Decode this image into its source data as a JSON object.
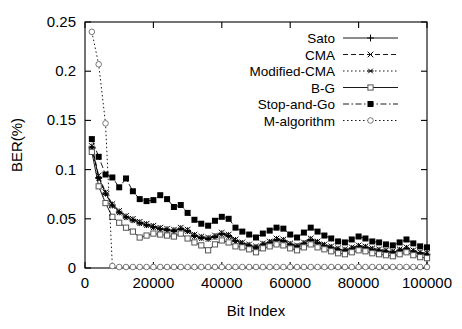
{
  "chart_data": {
    "type": "line",
    "title": "",
    "xlabel": "Bit Index",
    "ylabel": "BER(%)",
    "xlim": [
      0,
      100000
    ],
    "ylim": [
      0,
      0.25
    ],
    "xticks": [
      0,
      20000,
      40000,
      60000,
      80000,
      100000
    ],
    "xtick_labels": [
      "0",
      "20000",
      "40000",
      "60000",
      "80000",
      "100000"
    ],
    "yticks": [
      0,
      0.05,
      0.1,
      0.15,
      0.2,
      0.25
    ],
    "ytick_labels": [
      "0",
      "0.05",
      "0.1",
      "0.15",
      "0.2",
      "0.25"
    ],
    "grid": false,
    "legend_position": "top-right",
    "x": [
      2000,
      4000,
      6000,
      8000,
      10000,
      12000,
      14000,
      16000,
      18000,
      20000,
      22000,
      24000,
      26000,
      28000,
      30000,
      32000,
      34000,
      36000,
      38000,
      40000,
      42000,
      44000,
      46000,
      48000,
      50000,
      52000,
      54000,
      56000,
      58000,
      60000,
      62000,
      64000,
      66000,
      68000,
      70000,
      72000,
      74000,
      76000,
      78000,
      80000,
      82000,
      84000,
      86000,
      88000,
      90000,
      92000,
      94000,
      96000,
      98000,
      100000
    ],
    "series": [
      {
        "name": "Sato",
        "marker": "plus",
        "line_style": "solid",
        "color": "#000000",
        "values": [
          0.123,
          0.092,
          0.076,
          0.064,
          0.057,
          0.052,
          0.049,
          0.046,
          0.044,
          0.042,
          0.04,
          0.039,
          0.038,
          0.04,
          0.038,
          0.033,
          0.031,
          0.03,
          0.032,
          0.035,
          0.033,
          0.028,
          0.025,
          0.023,
          0.021,
          0.024,
          0.026,
          0.029,
          0.028,
          0.024,
          0.022,
          0.025,
          0.029,
          0.026,
          0.023,
          0.021,
          0.019,
          0.018,
          0.02,
          0.022,
          0.021,
          0.019,
          0.018,
          0.017,
          0.016,
          0.018,
          0.02,
          0.017,
          0.015,
          0.014
        ]
      },
      {
        "name": "CMA",
        "marker": "cross",
        "line_style": "dashed",
        "color": "#000000",
        "values": [
          0.124,
          0.094,
          0.077,
          0.065,
          0.058,
          0.053,
          0.05,
          0.047,
          0.045,
          0.043,
          0.041,
          0.04,
          0.039,
          0.041,
          0.039,
          0.034,
          0.032,
          0.031,
          0.033,
          0.036,
          0.034,
          0.029,
          0.026,
          0.024,
          0.022,
          0.025,
          0.027,
          0.03,
          0.029,
          0.025,
          0.023,
          0.026,
          0.03,
          0.027,
          0.024,
          0.022,
          0.02,
          0.019,
          0.021,
          0.023,
          0.022,
          0.02,
          0.019,
          0.018,
          0.017,
          0.019,
          0.021,
          0.018,
          0.016,
          0.015
        ]
      },
      {
        "name": "Modified-CMA",
        "marker": "star",
        "line_style": "dotted",
        "color": "#000000",
        "values": [
          0.122,
          0.091,
          0.075,
          0.063,
          0.056,
          0.051,
          0.048,
          0.045,
          0.043,
          0.041,
          0.039,
          0.038,
          0.037,
          0.039,
          0.037,
          0.032,
          0.03,
          0.029,
          0.031,
          0.034,
          0.032,
          0.027,
          0.024,
          0.022,
          0.02,
          0.023,
          0.025,
          0.028,
          0.027,
          0.023,
          0.021,
          0.024,
          0.028,
          0.025,
          0.022,
          0.02,
          0.018,
          0.017,
          0.019,
          0.021,
          0.02,
          0.018,
          0.017,
          0.016,
          0.015,
          0.017,
          0.019,
          0.016,
          0.014,
          0.013
        ]
      },
      {
        "name": "B-G",
        "marker": "opensquare",
        "line_style": "solid",
        "color": "#000000",
        "values": [
          0.118,
          0.083,
          0.066,
          0.052,
          0.046,
          0.041,
          0.037,
          0.031,
          0.033,
          0.035,
          0.034,
          0.033,
          0.032,
          0.035,
          0.03,
          0.026,
          0.023,
          0.018,
          0.024,
          0.028,
          0.026,
          0.022,
          0.021,
          0.019,
          0.016,
          0.02,
          0.022,
          0.024,
          0.023,
          0.02,
          0.018,
          0.021,
          0.024,
          0.021,
          0.019,
          0.017,
          0.015,
          0.014,
          0.016,
          0.018,
          0.017,
          0.015,
          0.014,
          0.013,
          0.012,
          0.014,
          0.016,
          0.013,
          0.011,
          0.01
        ]
      },
      {
        "name": "Stop-and-Go",
        "marker": "filledsquare",
        "line_style": "dashdot",
        "color": "#000000",
        "values": [
          0.131,
          0.113,
          0.095,
          0.092,
          0.082,
          0.091,
          0.078,
          0.07,
          0.068,
          0.069,
          0.074,
          0.07,
          0.062,
          0.064,
          0.056,
          0.049,
          0.045,
          0.043,
          0.048,
          0.052,
          0.05,
          0.041,
          0.037,
          0.034,
          0.031,
          0.035,
          0.038,
          0.041,
          0.04,
          0.034,
          0.031,
          0.036,
          0.041,
          0.037,
          0.033,
          0.03,
          0.027,
          0.026,
          0.029,
          0.032,
          0.03,
          0.027,
          0.026,
          0.024,
          0.023,
          0.026,
          0.029,
          0.025,
          0.022,
          0.021
        ]
      },
      {
        "name": "M-algorithm",
        "marker": "opencircle",
        "line_style": "dotted",
        "color": "#000000",
        "values": [
          0.24,
          0.207,
          0.147,
          0.002,
          0.001,
          0.001,
          0.001,
          0.001,
          0.001,
          0.001,
          0.001,
          0.001,
          0.001,
          0.001,
          0.001,
          0.001,
          0.001,
          0.001,
          0.001,
          0.001,
          0.001,
          0.001,
          0.001,
          0.001,
          0.001,
          0.001,
          0.001,
          0.001,
          0.001,
          0.001,
          0.001,
          0.001,
          0.001,
          0.001,
          0.001,
          0.001,
          0.001,
          0.001,
          0.001,
          0.001,
          0.001,
          0.001,
          0.001,
          0.001,
          0.001,
          0.001,
          0.001,
          0.001,
          0.001,
          0.001
        ]
      }
    ]
  }
}
